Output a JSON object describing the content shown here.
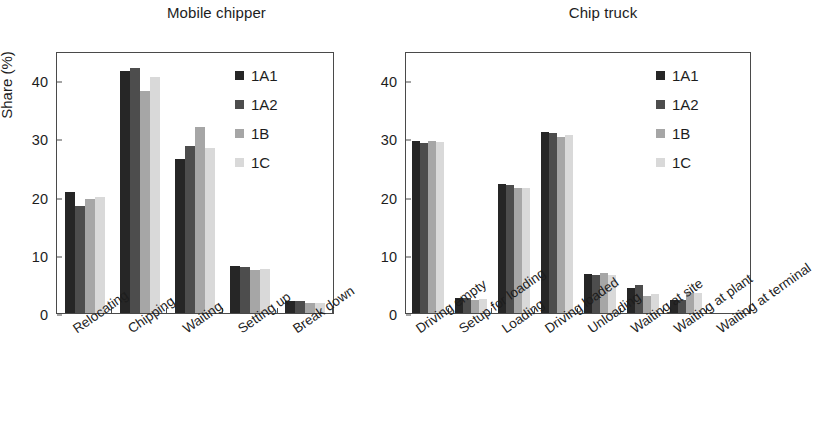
{
  "axis": {
    "ylabel": "Share (%)",
    "yticks": [
      0,
      10,
      20,
      30,
      40
    ],
    "ymin": 0,
    "ymax": 45
  },
  "legend": {
    "entries": [
      {
        "label": "1A1",
        "color": "#262626"
      },
      {
        "label": "1A2",
        "color": "#4d4d4d"
      },
      {
        "label": "1B",
        "color": "#a6a6a6"
      },
      {
        "label": "1C",
        "color": "#d9d9d9"
      }
    ]
  },
  "chart_data": [
    {
      "type": "bar",
      "title": "Mobile chipper",
      "xlabel": "",
      "ylabel": "Share (%)",
      "ylim": [
        0,
        45
      ],
      "yticks": [
        0,
        10,
        20,
        30,
        40
      ],
      "grid": false,
      "legend_position": "top-right",
      "categories": [
        "Relocating",
        "Chipping",
        "Waiting",
        "Setting up",
        "Break down"
      ],
      "series": [
        {
          "name": "1A1",
          "color": "#262626",
          "values": [
            20.8,
            41.5,
            26.5,
            8.0,
            2.1
          ]
        },
        {
          "name": "1A2",
          "color": "#4d4d4d",
          "values": [
            18.4,
            42.0,
            28.7,
            7.9,
            2.0
          ]
        },
        {
          "name": "1B",
          "color": "#a6a6a6",
          "values": [
            19.5,
            38.2,
            32.0,
            7.4,
            1.7
          ]
        },
        {
          "name": "1C",
          "color": "#d9d9d9",
          "values": [
            20.0,
            40.5,
            28.3,
            7.6,
            1.7
          ]
        }
      ]
    },
    {
      "type": "bar",
      "title": "Chip truck",
      "xlabel": "",
      "ylabel": "",
      "ylim": [
        0,
        45
      ],
      "yticks": [
        0,
        10,
        20,
        30,
        40
      ],
      "grid": false,
      "legend_position": "top-right",
      "categories": [
        "Driving empty",
        "Setup for loading",
        "Loading",
        "Driving loaded",
        "Unloading",
        "Waiting at site",
        "Waiting at plant",
        "Waiting at terminal"
      ],
      "series": [
        {
          "name": "1A1",
          "color": "#262626",
          "values": [
            29.5,
            2.6,
            22.1,
            31.1,
            6.7,
            4.3,
            2.3,
            0.0
          ]
        },
        {
          "name": "1A2",
          "color": "#4d4d4d",
          "values": [
            29.2,
            2.5,
            22.0,
            30.9,
            6.6,
            4.8,
            2.2,
            0.0
          ]
        },
        {
          "name": "1B",
          "color": "#a6a6a6",
          "values": [
            29.6,
            2.3,
            21.4,
            30.2,
            6.9,
            2.9,
            3.5,
            0.0
          ]
        },
        {
          "name": "1C",
          "color": "#d9d9d9",
          "values": [
            29.4,
            2.4,
            21.5,
            30.6,
            6.5,
            3.3,
            3.4,
            0.6
          ]
        }
      ]
    }
  ]
}
